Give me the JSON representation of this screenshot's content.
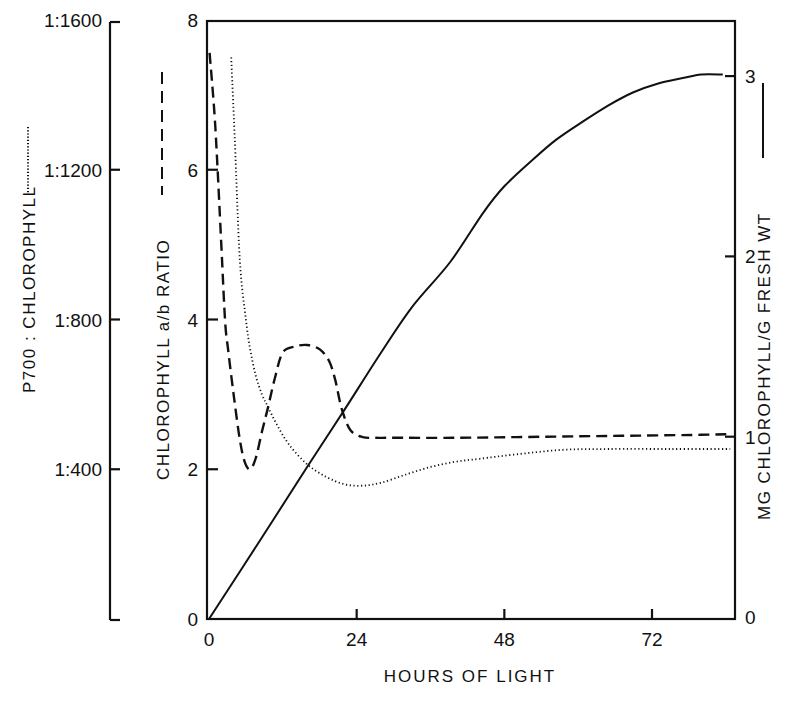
{
  "chart_data": {
    "type": "line",
    "title": "",
    "xlabel": "HOURS OF LIGHT",
    "xlim": [
      0,
      85
    ],
    "xticks": [
      0,
      24,
      48,
      72
    ],
    "grid": false,
    "legend": "inline in axis titles (line style swatch next to each axis label)",
    "axes": {
      "far_left": {
        "label": "P700 : CHLOROPHYLL",
        "line_style": "dotted",
        "ticks": [
          "1:400",
          "1:800",
          "1:1200",
          "1:1600"
        ],
        "tick_values": [
          400,
          800,
          1200,
          1600
        ],
        "range": [
          0,
          1600
        ]
      },
      "left": {
        "label": "CHLOROPHYLL a/b RATIO",
        "line_style": "dashed",
        "ticks": [
          "0",
          "2",
          "4",
          "6",
          "8"
        ],
        "tick_values": [
          0,
          2,
          4,
          6,
          8
        ],
        "range": [
          0,
          8
        ]
      },
      "right": {
        "label": "MG CHLOROPHYLL/G FRESH WT",
        "line_style": "solid",
        "ticks": [
          "0",
          "1",
          "2",
          "3"
        ],
        "tick_values": [
          0,
          1,
          2,
          3
        ],
        "range": [
          0,
          3
        ]
      }
    },
    "series": [
      {
        "name": "Chlorophyll a/b ratio",
        "axis": "left",
        "style": "dashed",
        "x": [
          0.1,
          1.0,
          2.0,
          2.6,
          3.1,
          4.0,
          5.0,
          5.8,
          6.7,
          7.6,
          8.6,
          9.6,
          10.8,
          12.0,
          14.0,
          16.0,
          18.0,
          19.5,
          20.5,
          21.6,
          23.0,
          25.0,
          27.0,
          30,
          40,
          50,
          60,
          70,
          80,
          84.7
        ],
        "values": [
          7.56,
          6.6,
          5.0,
          4.0,
          3.6,
          3.0,
          2.4,
          2.1,
          2.0,
          2.15,
          2.5,
          2.83,
          3.25,
          3.56,
          3.64,
          3.66,
          3.6,
          3.45,
          3.2,
          2.8,
          2.52,
          2.43,
          2.42,
          2.42,
          2.42,
          2.43,
          2.44,
          2.45,
          2.46,
          2.47
        ]
      },
      {
        "name": "P700 : chlorophyll",
        "axis": "far_left",
        "style": "dotted",
        "x": [
          3.6,
          4.2,
          5.0,
          6.0,
          6.7,
          7.6,
          8.6,
          9.6,
          11.0,
          13.0,
          15.9,
          19.0,
          22.0,
          24.9,
          28.0,
          32.0,
          36.0,
          40.0,
          44.0,
          50.0,
          57.5,
          65.0,
          75.0,
          84.7
        ],
        "values_ab_scale": [
          7.5,
          6.4,
          4.8,
          4.0,
          3.6,
          3.25,
          3.0,
          2.83,
          2.6,
          2.33,
          2.07,
          1.9,
          1.8,
          1.78,
          1.82,
          1.93,
          2.03,
          2.1,
          2.14,
          2.2,
          2.26,
          2.27,
          2.27,
          2.27
        ],
        "values": [
          1500,
          1280,
          960,
          800,
          720,
          650,
          600,
          566,
          520,
          466,
          414,
          380,
          360,
          356,
          364,
          386,
          406,
          420,
          428,
          440,
          452,
          454,
          454,
          454
        ]
      },
      {
        "name": "mg chlorophyll / g fresh wt",
        "axis": "right",
        "style": "solid",
        "x": [
          0,
          8,
          15.9,
          22,
          28,
          33,
          39.2,
          44.5,
          48,
          52.7,
          56.5,
          60.8,
          65,
          68.9,
          73,
          77,
          80,
          83.5
        ],
        "values": [
          0,
          0.42,
          0.84,
          1.16,
          1.48,
          1.73,
          1.98,
          2.25,
          2.4,
          2.55,
          2.66,
          2.76,
          2.85,
          2.92,
          2.97,
          3.0,
          3.02,
          3.02
        ]
      }
    ]
  }
}
